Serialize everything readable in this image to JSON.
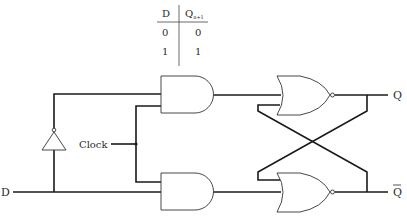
{
  "truth_table": {
    "headers": [
      "D",
      "Q",
      "n+1"
    ],
    "rows": [
      [
        "0",
        "0"
      ],
      [
        "1",
        "1"
      ]
    ]
  },
  "labels": {
    "input_d": "D",
    "clock": "Clock",
    "output_q": "Q",
    "output_q_bar": "Q"
  },
  "components": {
    "inverter": "NOT gate",
    "and_gates": [
      "AND gate (upper)",
      "AND gate (lower)"
    ],
    "nor_gates": [
      "NOR gate (upper)",
      "NOR gate (lower)"
    ]
  }
}
